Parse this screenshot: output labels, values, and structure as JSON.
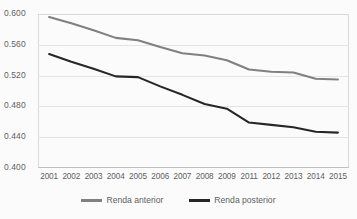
{
  "chart_data": {
    "type": "line",
    "title": "",
    "subtitle": "",
    "xlabel": "",
    "ylabel": "",
    "categories": [
      "2001",
      "2002",
      "2003",
      "2004",
      "2005",
      "2006",
      "2007",
      "2008",
      "2009",
      "2011",
      "2012",
      "2013",
      "2014",
      "2015"
    ],
    "ylim": [
      0.4,
      0.6
    ],
    "yticks": [
      "0.400",
      "0.440",
      "0.480",
      "0.520",
      "0.560",
      "0.600"
    ],
    "ytick_values": [
      0.4,
      0.44,
      0.48,
      0.52,
      0.56,
      0.6
    ],
    "grid": true,
    "legend_position": "bottom",
    "series": [
      {
        "name": "Renda anterior",
        "color": "#808080",
        "values": [
          0.596,
          0.588,
          0.579,
          0.569,
          0.566,
          0.557,
          0.549,
          0.546,
          0.54,
          0.528,
          0.525,
          0.524,
          0.516,
          0.515
        ]
      },
      {
        "name": "Renda posterior",
        "color": "#262626",
        "values": [
          0.548,
          0.538,
          0.529,
          0.519,
          0.518,
          0.506,
          0.495,
          0.483,
          0.477,
          0.459,
          0.456,
          0.453,
          0.447,
          0.446
        ]
      }
    ]
  },
  "legend": {
    "items": [
      {
        "label": "Renda anterior"
      },
      {
        "label": "Renda posterior"
      }
    ]
  },
  "colors": {
    "series_anterior": "#808080",
    "series_posterior": "#262626",
    "gridline": "#e4e4e4",
    "axis": "#bfbfbf",
    "text": "#5f5f5f",
    "background": "#fbfbfb"
  }
}
